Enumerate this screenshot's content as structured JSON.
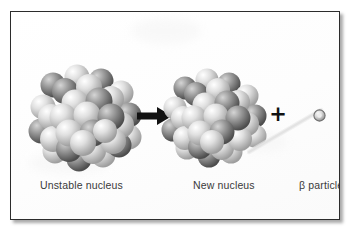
{
  "figure": {
    "background_color": "#fdfdfd",
    "border_color": "#2c2c2c"
  },
  "diagram": {
    "type": "process-diagram",
    "steps": [
      {
        "id": "unstable-nucleus",
        "label": "Unstable nucleus",
        "kind": "nucleon-cluster",
        "nucleon_count": 46,
        "radius_px": 52,
        "center": {
          "x": 75,
          "y": 105
        }
      },
      {
        "id": "new-nucleus",
        "label": "New nucleus",
        "kind": "nucleon-cluster",
        "nucleon_count": 44,
        "radius_px": 47,
        "center": {
          "x": 207,
          "y": 105
        }
      },
      {
        "id": "beta-particle",
        "label": "β particle",
        "kind": "point-particle",
        "radius_px": 6,
        "center": {
          "x": 308,
          "y": 102
        }
      }
    ],
    "connectors": [
      {
        "id": "reaction-arrow",
        "kind": "arrow",
        "direction": "right",
        "color": "#111111",
        "from": "unstable-nucleus",
        "to": "new-nucleus"
      },
      {
        "id": "plus-operator",
        "kind": "operator",
        "symbol": "+",
        "color": "#111111"
      },
      {
        "id": "beta-trail",
        "kind": "emission-track",
        "color": "#d2d2d2",
        "from": "new-nucleus",
        "to": "beta-particle"
      }
    ],
    "nucleon_colors": {
      "light": "#e2e2e2",
      "light_shadow": "#9b9b9b",
      "dark": "#9a9a9a",
      "dark_shadow": "#4a4a4a",
      "highlight": "#ffffff"
    },
    "text_color": "#3a3a3a"
  },
  "labels": {
    "unstable_nucleus": "Unstable nucleus",
    "new_nucleus": "New nucleus",
    "beta_particle": "β particle"
  },
  "icons": {
    "arrow": "arrow-right-icon",
    "plus": "plus-icon",
    "particle": "beta-particle-icon"
  }
}
